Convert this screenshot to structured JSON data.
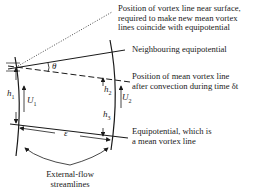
{
  "labels": {
    "vortex_near_surface": [
      "Position of vortex line near surface,",
      "required to make new mean vortex",
      "lines coincide with equipotential"
    ],
    "neighbouring_equipotential": "Neighbouring equipotential",
    "mean_vortex_after": [
      "Position of mean vortex line",
      "after convection during time δt"
    ],
    "equipotential_mean": [
      "Equipotential, which is",
      "a mean vortex line"
    ],
    "streamlines": [
      "External-flow",
      "streamlines"
    ]
  },
  "symbols": {
    "theta": "θ",
    "h1": "h",
    "h1_sub": "1",
    "U1": "U",
    "U1_sub": "1",
    "h2": "h",
    "h2_sub": "2",
    "U2": "U",
    "U2_sub": "2",
    "h3": "h",
    "h3_sub": "3",
    "epsilon": "ε"
  },
  "colors": {
    "line": "#1a1a1a",
    "background": "#ffffff"
  }
}
